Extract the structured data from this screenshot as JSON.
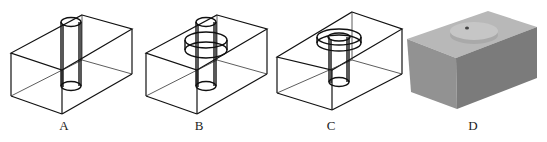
{
  "figure": {
    "panels": [
      {
        "id": "A",
        "label": "A",
        "description": "Wireframe box with straight vertical through-hole"
      },
      {
        "id": "B",
        "label": "B",
        "description": "Wireframe box with through-hole and internal circular groove"
      },
      {
        "id": "C",
        "label": "C",
        "description": "Wireframe box with counterbored through-hole"
      },
      {
        "id": "D",
        "label": "D",
        "description": "Shaded solid box with raised disc on top and small hole"
      }
    ],
    "colors": {
      "line": "#111111",
      "solid_top": "#b8b8b8",
      "solid_left": "#929292",
      "solid_right": "#7b7b7b",
      "disc": "#c4c4c4"
    }
  }
}
